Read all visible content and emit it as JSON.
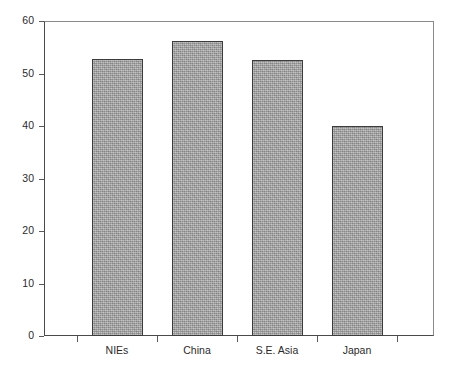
{
  "chart_data": {
    "type": "bar",
    "title": "",
    "subtitle": "",
    "xlabel": "",
    "ylabel": "",
    "categories": [
      "NIEs",
      "China",
      "S.E. Asia",
      "Japan"
    ],
    "values": [
      52.8,
      56.2,
      52.6,
      40.0
    ],
    "ylim": [
      0,
      60
    ],
    "yticks": [
      0,
      10,
      20,
      30,
      40,
      50,
      60
    ],
    "ytick_labels": [
      "0",
      "10",
      "20",
      "30",
      "40",
      "50",
      "60"
    ],
    "grid": false,
    "legend": null,
    "annotations": [],
    "series": [
      {
        "name": "",
        "values": [
          52.8,
          56.2,
          52.6,
          40.0
        ]
      }
    ]
  },
  "style": {
    "bar_fill": "#a9a9a9",
    "bar_border": "#3c3c3c",
    "axis_color": "#4a4a4a",
    "frame_color": "#8a8a8a",
    "text_color": "#2b2b2b",
    "background": "#ffffff"
  }
}
